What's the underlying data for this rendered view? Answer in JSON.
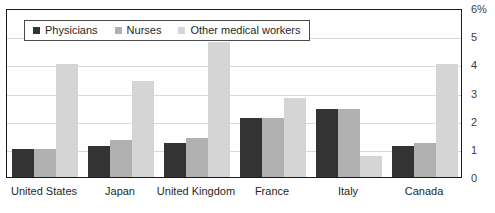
{
  "chart_data": {
    "type": "bar",
    "title": "",
    "xlabel": "",
    "ylabel": "",
    "ylim": [
      0,
      6
    ],
    "grid": true,
    "legend_position": "top-left inside plot area",
    "categories": [
      "United States",
      "Japan",
      "United Kingdom",
      "France",
      "Italy",
      "Canada"
    ],
    "ytick_labels": [
      "6%",
      "5",
      "4",
      "3",
      "2",
      "1",
      "0"
    ],
    "ytick_values": [
      6,
      5,
      4,
      3,
      2,
      1,
      0
    ],
    "series": [
      {
        "name": "Physicians",
        "color": "#333333",
        "values": [
          1.0,
          1.1,
          1.2,
          2.1,
          2.4,
          1.1
        ]
      },
      {
        "name": "Nurses",
        "color": "#b0b0b0",
        "values": [
          1.0,
          1.3,
          1.4,
          2.1,
          2.4,
          1.2
        ]
      },
      {
        "name": "Other medical workers",
        "color": "#d5d5d5",
        "values": [
          4.0,
          3.4,
          4.8,
          2.8,
          0.75,
          4.0
        ]
      }
    ]
  },
  "legend": {
    "items": [
      {
        "label": "Physicians",
        "color": "#333333"
      },
      {
        "label": "Nurses",
        "color": "#b0b0b0"
      },
      {
        "label": "Other medical workers",
        "color": "#d5d5d5"
      }
    ]
  },
  "colors": {
    "physicians": "#333333",
    "nurses": "#b0b0b0",
    "other_medical_workers": "#d5d5d5",
    "axis": "#1a1a1a",
    "gridline": "#d9d9d9"
  }
}
